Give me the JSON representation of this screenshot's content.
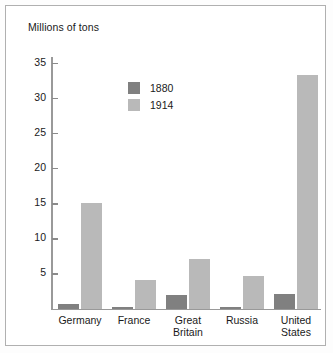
{
  "chart_data": {
    "type": "bar",
    "title": "Millions of tons",
    "xlabel": "",
    "ylabel": "Millions of tons",
    "ylim": [
      0,
      36
    ],
    "yticks": [
      5,
      10,
      15,
      20,
      25,
      30,
      35
    ],
    "ytick_labels": [
      "5",
      "10",
      "15",
      "20",
      "25",
      "30",
      "35"
    ],
    "grid": false,
    "legend_position": "upper-left-inside",
    "categories": [
      "Germany",
      "France",
      "Great\nBritain",
      "Russia",
      "United\nStates"
    ],
    "series": [
      {
        "name": "1880",
        "color": "#808080",
        "values": [
          0.6,
          0.2,
          1.9,
          0.25,
          2.0
        ]
      },
      {
        "name": "1914",
        "color": "#b9b9b9",
        "values": [
          15.0,
          4.1,
          7.0,
          4.6,
          33.2
        ]
      }
    ]
  },
  "legend": {
    "entries": [
      {
        "label": "1880",
        "color": "#808080"
      },
      {
        "label": "1914",
        "color": "#b9b9b9"
      }
    ]
  },
  "colors": {
    "series_1880": "#808080",
    "series_1914": "#b9b9b9",
    "axis": "#999999",
    "text": "#1a1a1a",
    "frame_border": "#b0b0b0",
    "background": "#ffffff"
  }
}
